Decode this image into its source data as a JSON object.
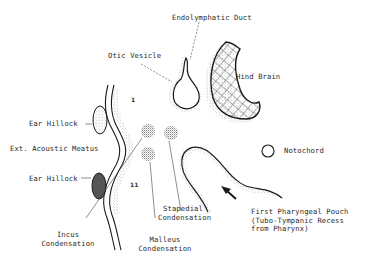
{
  "diagram": {
    "labels": {
      "endolymphatic_duct": "Endolymphatic Duct",
      "otic_vesicle": "Otic Vesicle",
      "hind_brain": "Hind Brain",
      "ear_hillock_upper": "Ear Hillock",
      "ext_acoustic_meatus": "Ext. Acoustic Meatus",
      "ear_hillock_lower": "Ear Hillock",
      "notochord": "Notochord",
      "stapedial_line1": "Stapedial",
      "stapedial_line2": "Condensation",
      "incus_line1": "Incus",
      "incus_line2": "Condensation",
      "malleus_line1": "Malleus",
      "malleus_line2": "Condensation",
      "pouch_line1": "First Pharyngeal Pouch",
      "pouch_line2": "(Tubo-Tympanic Recess",
      "pouch_line3": "from Pharynx)",
      "arch_1": "1",
      "arch_2": "11"
    },
    "colors": {
      "ink": "#1a1a1a",
      "stipple": "#9a9a9a",
      "hillock_upper": "#b8b8b8",
      "hillock_lower": "#555555",
      "background": "#ffffff"
    }
  }
}
